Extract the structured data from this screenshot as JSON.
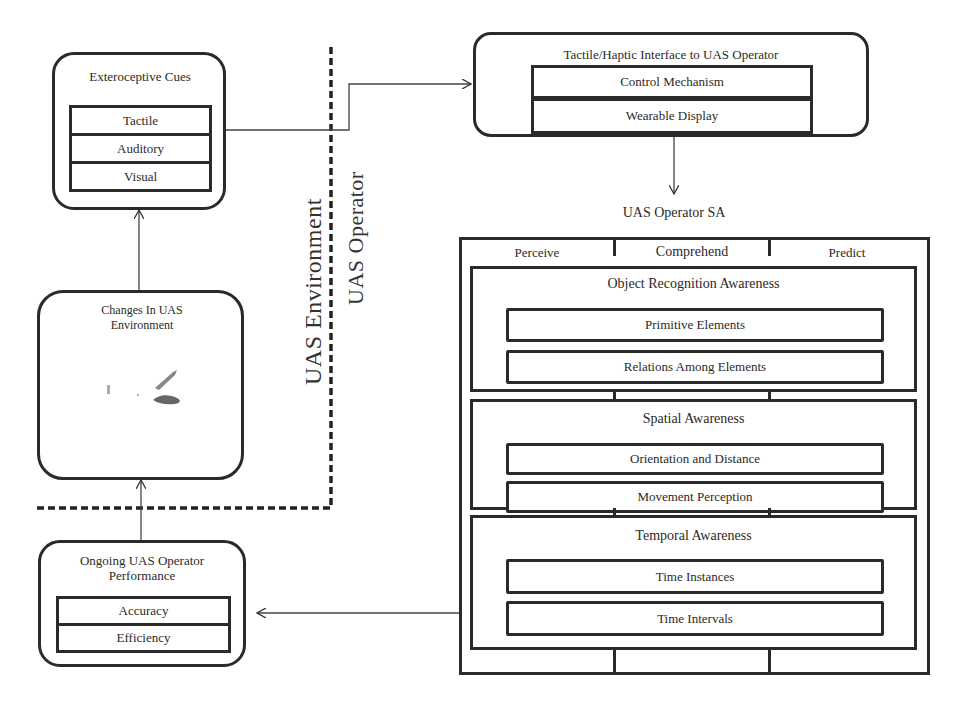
{
  "exteroceptive": {
    "title": "Exteroceptive Cues",
    "items": [
      "Tactile",
      "Auditory",
      "Visual"
    ]
  },
  "changes": {
    "title": "Changes In UAS Environment"
  },
  "ongoing": {
    "title": "Ongoing UAS Operator Performance",
    "items": [
      "Accuracy",
      "Efficiency"
    ]
  },
  "boundary": {
    "left_label": "UAS Environment",
    "right_label": "UAS Operator"
  },
  "tactile_interface": {
    "title": "Tactile/Haptic Interface to UAS Operator",
    "items": [
      "Control Mechanism",
      "Wearable Display"
    ]
  },
  "sa": {
    "label": "UAS Operator SA",
    "stages": [
      "Perceive",
      "Comprehend",
      "Predict"
    ],
    "groups": [
      {
        "title": "Object Recognition Awareness",
        "items": [
          "Primitive Elements",
          "Relations Among Elements"
        ]
      },
      {
        "title": "Spatial Awareness",
        "items": [
          "Orientation and Distance",
          "Movement Perception"
        ]
      },
      {
        "title": "Temporal Awareness",
        "items": [
          "Time Instances",
          "Time Intervals"
        ]
      }
    ]
  }
}
